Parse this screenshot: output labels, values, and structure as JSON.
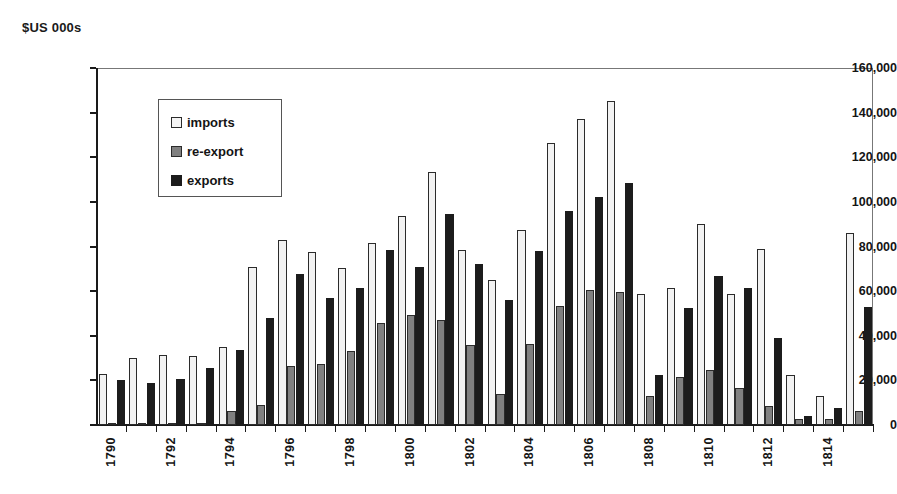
{
  "chart_data": {
    "type": "bar",
    "title": "$US 000s",
    "subtitle": "",
    "xlabel": "",
    "ylabel": "$US 000s",
    "ylim": [
      0,
      160000
    ],
    "ytick_step": 20000,
    "ytick_labels": [
      "0",
      "20,000",
      "40,000",
      "60,000",
      "80,000",
      "100,000",
      "120,000",
      "140,000",
      "160,000"
    ],
    "ytick_values": [
      0,
      20000,
      40000,
      60000,
      80000,
      100000,
      120000,
      140000,
      160000
    ],
    "grid": false,
    "legend_position": "upper-left-inside",
    "categories": [
      1790,
      1791,
      1792,
      1793,
      1794,
      1795,
      1796,
      1797,
      1798,
      1799,
      1800,
      1801,
      1802,
      1803,
      1804,
      1805,
      1806,
      1807,
      1808,
      1809,
      1810,
      1811,
      1812,
      1813,
      1814,
      1815
    ],
    "xtick_labels": [
      "1790",
      "",
      "1792",
      "",
      "1794",
      "",
      "1796",
      "",
      "1798",
      "",
      "1800",
      "",
      "1802",
      "",
      "1804",
      "",
      "1806",
      "",
      "1808",
      "",
      "1810",
      "",
      "1812",
      "",
      "1814",
      ""
    ],
    "series": [
      {
        "name": "imports",
        "color": "#f2f2f2",
        "edge_color": "#2b2b2b",
        "values": [
          23000,
          30000,
          31500,
          31000,
          35000,
          71000,
          83000,
          77500,
          70500,
          81500,
          93500,
          113500,
          78500,
          65000,
          87500,
          126500,
          137000,
          145000,
          58500,
          61500,
          90000,
          58500,
          79000,
          22500,
          13000,
          86000
        ]
      },
      {
        "name": "re-export",
        "color": "#808080",
        "edge_color": "#2b2b2b",
        "values": [
          500,
          500,
          1000,
          1000,
          6500,
          9000,
          26500,
          27500,
          33000,
          45500,
          49500,
          47000,
          36000,
          14000,
          36500,
          53500,
          60500,
          59500,
          13000,
          21500,
          24500,
          16500,
          8500,
          2500,
          2500,
          6500
        ]
      },
      {
        "name": "exports",
        "color": "#1c1c1c",
        "edge_color": "#1c1c1c",
        "values": [
          20000,
          19000,
          20500,
          25500,
          33500,
          48000,
          67500,
          57000,
          61500,
          78500,
          71000,
          94500,
          72000,
          56000,
          78000,
          96000,
          102000,
          108500,
          22500,
          52500,
          67000,
          61500,
          39000,
          4000,
          7500,
          53000
        ]
      }
    ]
  }
}
